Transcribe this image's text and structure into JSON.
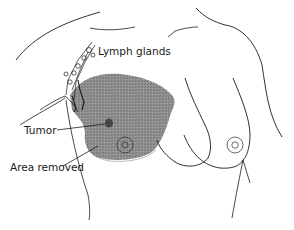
{
  "figure": {
    "labels": {
      "lymph_glands": "Lymph glands",
      "tumor": "Tumor",
      "area_removed": "Area removed"
    },
    "colors": {
      "line": "#1a1a1a",
      "shaded_area": "#8c8c8c",
      "tumor": "#3a3a3a",
      "background": "#ffffff"
    }
  }
}
